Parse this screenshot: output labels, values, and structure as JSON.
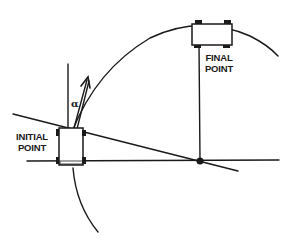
{
  "diagram": {
    "labels": {
      "initial_point_line1": "INITIAL",
      "initial_point_line2": "POINT",
      "final_point_line1": "FINAL",
      "final_point_line2": "POINT",
      "angle_symbol": "α"
    },
    "colors": {
      "stroke": "#1a1a1a",
      "background": "#ffffff"
    },
    "elements": [
      "initial-robot",
      "final-robot",
      "circular-arc-path",
      "heading-arrow",
      "angle-alpha",
      "horizontal-axis-line",
      "slanted-tangent-line",
      "vertical-reference-line",
      "intersection-point"
    ]
  }
}
